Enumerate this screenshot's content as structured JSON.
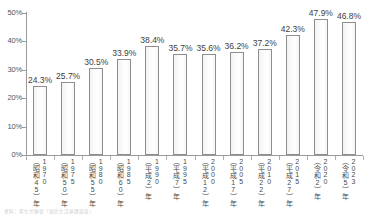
{
  "chart_data": {
    "type": "bar",
    "title": "",
    "xlabel": "",
    "ylabel": "",
    "ylim": [
      0,
      50
    ],
    "ytick_labels": [
      "50%",
      "40%",
      "30%",
      "20%",
      "10%",
      "0%"
    ],
    "ytick_values": [
      50,
      40,
      30,
      20,
      10,
      0
    ],
    "grid": false,
    "legend": "none",
    "categories": [
      "（昭和45）年 1970",
      "（昭和50）年 1975",
      "（昭和55）年 1980",
      "（昭和60）年 1985",
      "（平成2）年 1990",
      "（平成7）年 1995",
      "（平成12）年 2000",
      "（平成17）年 2005",
      "（平成22）年 2010",
      "（平成27）年 2015",
      "（令和2）年 2020",
      "（令和5）年 2023"
    ],
    "values": [
      24.3,
      25.7,
      30.5,
      33.9,
      38.4,
      35.7,
      35.6,
      36.2,
      37.2,
      42.3,
      47.9,
      46.8
    ],
    "value_labels": [
      "24.3%",
      "25.7%",
      "30.5%",
      "33.9%",
      "38.4%",
      "35.7%",
      "35.6%",
      "36.2%",
      "37.2%",
      "42.3%",
      "47.9%",
      "46.8%"
    ],
    "bar_color": "#fbfbfb",
    "bar_border_color": "#8e8e8e",
    "axis_color": "#9a9a9a"
  },
  "axis": {
    "y_ticks": [
      {
        "label": "50%",
        "value": 50
      },
      {
        "label": "40%",
        "value": 40
      },
      {
        "label": "30%",
        "value": 30
      },
      {
        "label": "20%",
        "value": 20
      },
      {
        "label": "10%",
        "value": 10
      },
      {
        "label": "0%",
        "value": 0
      }
    ]
  },
  "x_labels": [
    {
      "era": "（昭和45）年",
      "west": "1970"
    },
    {
      "era": "（昭和50）年",
      "west": "1975"
    },
    {
      "era": "（昭和55）年",
      "west": "1980"
    },
    {
      "era": "（昭和60）年",
      "west": "1985"
    },
    {
      "era": "（平成2）年",
      "west": "1990"
    },
    {
      "era": "（平成7）年",
      "west": "1995"
    },
    {
      "era": "（平成12）年",
      "west": "2000"
    },
    {
      "era": "（平成17）年",
      "west": "2005"
    },
    {
      "era": "（平成22）年",
      "west": "2010"
    },
    {
      "era": "（平成27）年",
      "west": "2015"
    },
    {
      "era": "（令和2）年",
      "west": "2020"
    },
    {
      "era": "（令和5）年",
      "west": "2023"
    }
  ],
  "footnote": {
    "text": "資料：厚生労働省「国民生活基礎調査」"
  }
}
